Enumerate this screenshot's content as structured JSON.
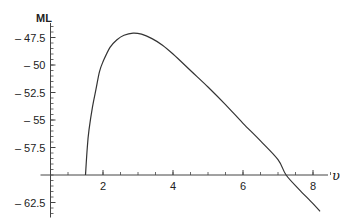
{
  "chart_data": {
    "type": "line",
    "title": "",
    "xlabel": "υ",
    "ylabel": "ML",
    "xlim": [
      0.5,
      8.5
    ],
    "ylim": [
      -63.5,
      -46
    ],
    "x_axis_crossing_y": -60,
    "y_axis_crossing_x": 0.5,
    "grid": false,
    "legend": null,
    "x_ticks": [
      2,
      4,
      6,
      8
    ],
    "x_tick_labels": [
      "2",
      "4",
      "6",
      "8"
    ],
    "x_minor_step": 0.5,
    "y_ticks": [
      -47.5,
      -50,
      -52.5,
      -55,
      -57.5,
      -62.5
    ],
    "y_tick_labels": [
      "– 47.5",
      "– 50",
      "– 52.5",
      "– 55",
      "– 57.5",
      "– 62.5"
    ],
    "y_minor_step": 0.5,
    "series": [
      {
        "name": "ML",
        "color": "#333333",
        "x": [
          1.5,
          1.55,
          1.6,
          1.7,
          1.8,
          1.9,
          2.0,
          2.2,
          2.4,
          2.6,
          2.86,
          3.1,
          3.4,
          3.7,
          4.0,
          4.5,
          5.0,
          5.5,
          6.0,
          6.5,
          7.0,
          7.23,
          7.6,
          8.0,
          8.2
        ],
        "y": [
          -60,
          -57.5,
          -55.9,
          -53.8,
          -52.2,
          -50.6,
          -49.7,
          -48.4,
          -47.7,
          -47.3,
          -47.1,
          -47.2,
          -47.6,
          -48.2,
          -49.0,
          -50.5,
          -52.0,
          -53.6,
          -55.3,
          -56.9,
          -58.6,
          -60,
          -61.3,
          -62.6,
          -63.3
        ]
      }
    ]
  }
}
